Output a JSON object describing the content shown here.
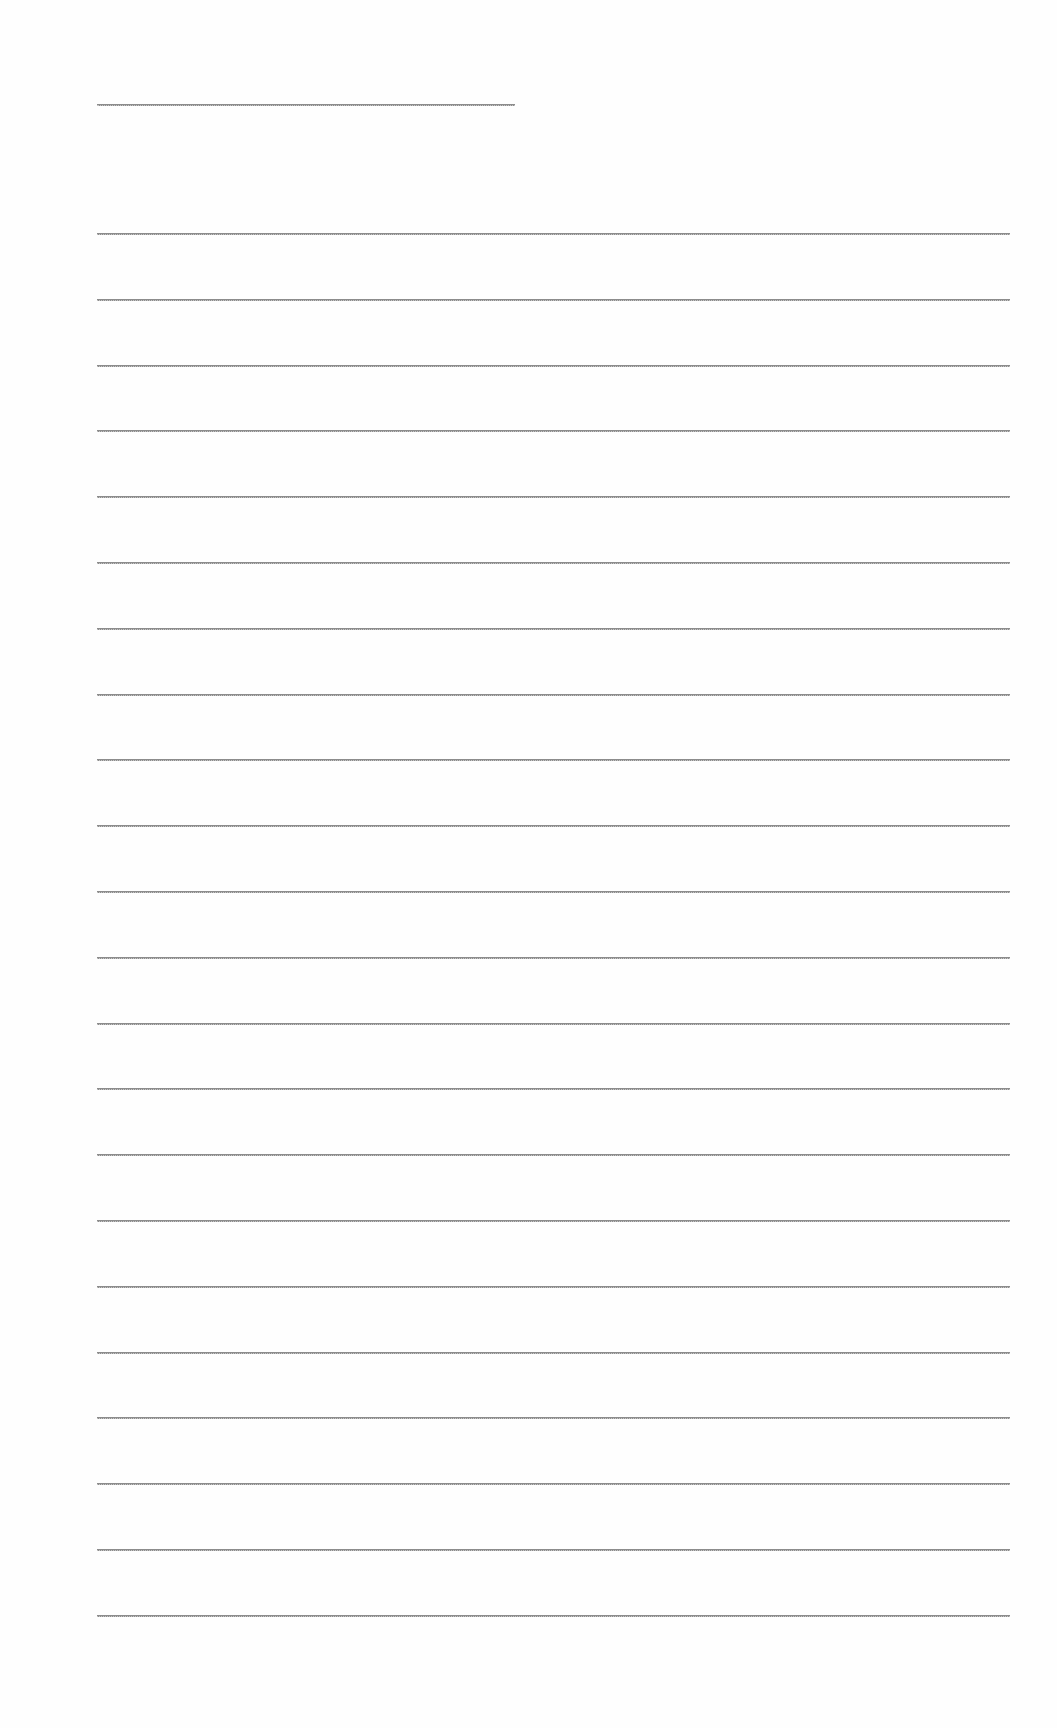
{
  "page": {
    "type": "blank-lined-sheet",
    "background_color": "#fefefe",
    "line_color": "#8c8c8c",
    "header_line": {
      "x": 97,
      "y": 104,
      "width": 418
    },
    "ruled_lines": {
      "count": 22,
      "x_start": 97,
      "x_end": 1010,
      "first_y": 233,
      "spacing": 65.8
    },
    "text": []
  }
}
